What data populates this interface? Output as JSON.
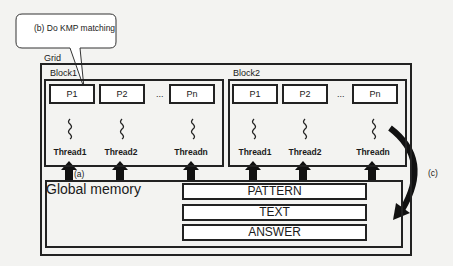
{
  "callout": {
    "text": "(b) Do KMP matching"
  },
  "grid": {
    "label": "Grid"
  },
  "blocks": [
    {
      "label": "Block1",
      "processors": [
        "P1",
        "P2",
        "Pn"
      ],
      "ellipsis": "...",
      "threads": [
        "Thread1",
        "Thread2",
        "Threadn"
      ]
    },
    {
      "label": "Block2",
      "processors": [
        "P1",
        "P2",
        "Pn"
      ],
      "ellipsis": "...",
      "threads": [
        "Thread1",
        "Thread2",
        "Threadn"
      ]
    }
  ],
  "global_memory": {
    "label": "Global memory",
    "sections": [
      "PATTERN",
      "TEXT",
      "ANSWER"
    ]
  },
  "annotations": {
    "a": "(a)",
    "c": "(c)"
  }
}
